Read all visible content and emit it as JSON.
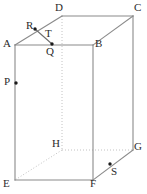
{
  "figure": {
    "name": "rectangular-prism-diagram",
    "width": 147,
    "height": 194,
    "background_color": "#ffffff",
    "visible_edge_color": "#8a8a8a",
    "hidden_edge_color": "#c2c2c2",
    "marker_color": "#1a1a1a",
    "label_color": "#2b2b2b"
  },
  "vertices": [
    {
      "id": "A",
      "label": "A",
      "x": 15,
      "y": 45,
      "label_x": 3,
      "label_y": 38,
      "hidden": false,
      "dot": false
    },
    {
      "id": "B",
      "label": "B",
      "x": 93,
      "y": 45,
      "label_x": 95,
      "label_y": 38,
      "hidden": false,
      "dot": false
    },
    {
      "id": "C",
      "label": "C",
      "x": 133,
      "y": 16,
      "label_x": 134,
      "label_y": 2,
      "hidden": false,
      "dot": false
    },
    {
      "id": "D",
      "label": "D",
      "x": 62,
      "y": 16,
      "label_x": 55,
      "label_y": 2,
      "hidden": false,
      "dot": false
    },
    {
      "id": "E",
      "label": "E",
      "x": 15,
      "y": 180,
      "label_x": 3,
      "label_y": 178,
      "hidden": false,
      "dot": false
    },
    {
      "id": "F",
      "label": "F",
      "x": 93,
      "y": 180,
      "label_x": 90,
      "label_y": 178,
      "hidden": false,
      "dot": false
    },
    {
      "id": "G",
      "label": "G",
      "x": 133,
      "y": 150,
      "label_x": 134,
      "label_y": 141,
      "hidden": false,
      "dot": false
    },
    {
      "id": "H",
      "label": "H",
      "x": 62,
      "y": 150,
      "label_x": 52,
      "label_y": 138,
      "hidden": true,
      "dot": false
    }
  ],
  "points": [
    {
      "id": "P",
      "label": "P",
      "x": 16,
      "y": 83,
      "label_x": 4,
      "label_y": 76,
      "on_edge": "A-E"
    },
    {
      "id": "Q",
      "label": "Q",
      "x": 52,
      "y": 44,
      "label_x": 46,
      "label_y": 46,
      "on_edge": "A-B"
    },
    {
      "id": "R",
      "label": "R",
      "x": 35,
      "y": 29,
      "label_x": 26,
      "label_y": 20,
      "on_edge": "A-D"
    },
    {
      "id": "S",
      "label": "S",
      "x": 110,
      "y": 164,
      "label_x": 111,
      "label_y": 166,
      "on_edge": "F-G"
    },
    {
      "id": "T",
      "label": "T",
      "x": 44,
      "y": 36,
      "label_x": 45,
      "label_y": 28,
      "on_edge": "R-Q"
    }
  ],
  "edges": [
    {
      "id": "A-B",
      "from": "A",
      "to": "B",
      "hidden": false
    },
    {
      "id": "B-F",
      "from": "B",
      "to": "F",
      "hidden": false
    },
    {
      "id": "F-E",
      "from": "F",
      "to": "E",
      "hidden": false
    },
    {
      "id": "E-A",
      "from": "E",
      "to": "A",
      "hidden": false
    },
    {
      "id": "A-D",
      "from": "A",
      "to": "D",
      "hidden": false
    },
    {
      "id": "D-C",
      "from": "D",
      "to": "C",
      "hidden": false
    },
    {
      "id": "C-B",
      "from": "C",
      "to": "B",
      "hidden": false
    },
    {
      "id": "C-G",
      "from": "C",
      "to": "G",
      "hidden": false
    },
    {
      "id": "G-F",
      "from": "G",
      "to": "F",
      "hidden": false
    },
    {
      "id": "D-H",
      "from": "D",
      "to": "H",
      "hidden": true
    },
    {
      "id": "H-G",
      "from": "H",
      "to": "G",
      "hidden": true
    },
    {
      "id": "H-E",
      "from": "H",
      "to": "E",
      "hidden": true
    }
  ],
  "segments": [
    {
      "id": "R-Q",
      "from": "R",
      "to": "Q",
      "label": "T",
      "style": "solid"
    }
  ]
}
